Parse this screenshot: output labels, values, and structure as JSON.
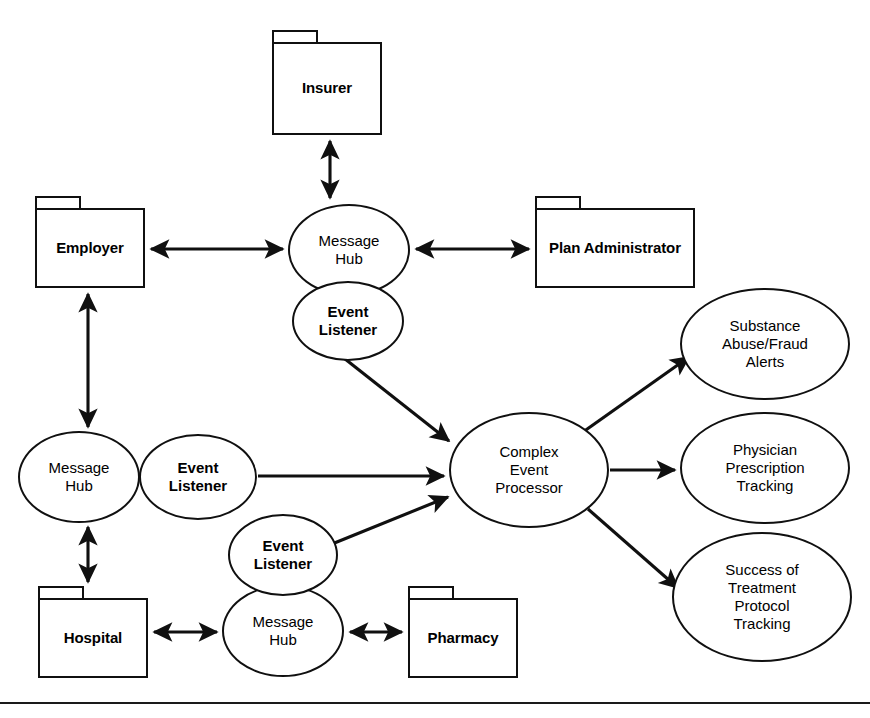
{
  "diagram": {
    "type": "component-event-flow",
    "stroke_color": "#101010",
    "background_color": "#ffffff",
    "nodes": [
      {
        "id": "insurer",
        "kind": "package",
        "label": "Insurer",
        "x": 272,
        "y": 30,
        "w": 110,
        "h": 105,
        "tab_w": 46
      },
      {
        "id": "employer",
        "kind": "package",
        "label": "Employer",
        "x": 35,
        "y": 196,
        "w": 110,
        "h": 92,
        "tab_w": 46
      },
      {
        "id": "plan_administrator",
        "kind": "package",
        "label": "Plan Administrator",
        "x": 535,
        "y": 196,
        "w": 160,
        "h": 92,
        "tab_w": 46
      },
      {
        "id": "hospital",
        "kind": "package",
        "label": "Hospital",
        "x": 38,
        "y": 586,
        "w": 110,
        "h": 92,
        "tab_w": 46
      },
      {
        "id": "pharmacy",
        "kind": "package",
        "label": "Pharmacy",
        "x": 408,
        "y": 586,
        "w": 110,
        "h": 92,
        "tab_w": 46
      },
      {
        "id": "hub_top",
        "kind": "ellipse",
        "label": "Message\nHub",
        "x": 288,
        "y": 204,
        "w": 122,
        "h": 92,
        "bold": false,
        "layer": "under"
      },
      {
        "id": "listener_top",
        "kind": "ellipse",
        "label": "Event\nListener",
        "x": 292,
        "y": 281,
        "w": 112,
        "h": 80,
        "bold": true,
        "layer": "overlap"
      },
      {
        "id": "hub_left",
        "kind": "ellipse",
        "label": "Message\nHub",
        "x": 18,
        "y": 431,
        "w": 122,
        "h": 92,
        "bold": false,
        "layer": "under"
      },
      {
        "id": "listener_left",
        "kind": "ellipse",
        "label": "Event\nListener",
        "x": 139,
        "y": 434,
        "w": 118,
        "h": 86,
        "bold": true,
        "layer": "overlap"
      },
      {
        "id": "listener_bot",
        "kind": "ellipse",
        "label": "Event\nListener",
        "x": 228,
        "y": 514,
        "w": 110,
        "h": 82,
        "bold": true,
        "layer": "overlap"
      },
      {
        "id": "hub_bot",
        "kind": "ellipse",
        "label": "Message\nHub",
        "x": 222,
        "y": 585,
        "w": 122,
        "h": 92,
        "bold": false,
        "layer": "under"
      },
      {
        "id": "cep",
        "kind": "ellipse",
        "label": "Complex\nEvent\nProcessor",
        "x": 449,
        "y": 412,
        "w": 160,
        "h": 116,
        "bold": false,
        "layer": "under"
      },
      {
        "id": "alerts",
        "kind": "ellipse",
        "label": "Substance\nAbuse/Fraud\nAlerts",
        "x": 680,
        "y": 288,
        "w": 170,
        "h": 112,
        "bold": false,
        "layer": "under"
      },
      {
        "id": "prescription",
        "kind": "ellipse",
        "label": "Physician\nPrescription\nTracking",
        "x": 680,
        "y": 412,
        "w": 170,
        "h": 112,
        "bold": false,
        "layer": "under"
      },
      {
        "id": "protocol",
        "kind": "ellipse",
        "label": "Success of\nTreatment\nProtocol\nTracking",
        "x": 672,
        "y": 532,
        "w": 180,
        "h": 130,
        "bold": false,
        "layer": "under"
      }
    ],
    "edges": [
      {
        "id": "e-insurer-hub",
        "from": "insurer",
        "to": "hub_top",
        "arrows": "both"
      },
      {
        "id": "e-employer-hub",
        "from": "employer",
        "to": "hub_top",
        "arrows": "both"
      },
      {
        "id": "e-hub-plan",
        "from": "hub_top",
        "to": "plan_administrator",
        "arrows": "both"
      },
      {
        "id": "e-employer-hubleft",
        "from": "employer",
        "to": "hub_left",
        "arrows": "both"
      },
      {
        "id": "e-listenertop-cep",
        "from": "listener_top",
        "to": "cep",
        "arrows": "to"
      },
      {
        "id": "e-listenerleft-cep",
        "from": "listener_left",
        "to": "cep",
        "arrows": "to"
      },
      {
        "id": "e-listenerbot-cep",
        "from": "listener_bot",
        "to": "cep",
        "arrows": "to"
      },
      {
        "id": "e-hubleft-hospital",
        "from": "hub_left",
        "to": "hospital",
        "arrows": "both"
      },
      {
        "id": "e-hospital-hubbot",
        "from": "hospital",
        "to": "hub_bot",
        "arrows": "both"
      },
      {
        "id": "e-hubbot-pharmacy",
        "from": "hub_bot",
        "to": "pharmacy",
        "arrows": "both"
      },
      {
        "id": "e-cep-alerts",
        "from": "cep",
        "to": "alerts",
        "arrows": "to"
      },
      {
        "id": "e-cep-prescription",
        "from": "cep",
        "to": "prescription",
        "arrows": "to"
      },
      {
        "id": "e-cep-protocol",
        "from": "cep",
        "to": "protocol",
        "arrows": "to"
      }
    ],
    "footer_rule_y": 702
  }
}
